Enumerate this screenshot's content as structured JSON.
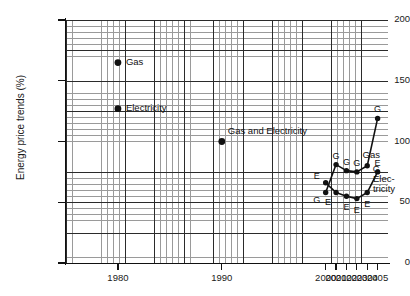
{
  "chart_data": {
    "type": "line",
    "title": "",
    "xlabel": "",
    "ylabel": "Energy price trends (%)",
    "xlim": [
      1975,
      2006
    ],
    "ylim": [
      0,
      200
    ],
    "grid": true,
    "legend": "inline-annotations",
    "x_ticks": [
      "1980",
      "1990",
      "2000",
      "2001",
      "2002",
      "2003",
      "2004",
      "2005"
    ],
    "x_tick_values": [
      1980,
      1990,
      2000,
      2001,
      2002,
      2003,
      2004,
      2005
    ],
    "y_ticks": [
      "0",
      "50",
      "100",
      "150",
      "200"
    ],
    "y_tick_values": [
      0,
      50,
      100,
      150,
      200
    ],
    "series": [
      {
        "name": "Gas",
        "marker_letter": "G",
        "x": [
          1980,
          1990,
          2000,
          2001,
          2002,
          2003,
          2004,
          2005
        ],
        "values": [
          165,
          100,
          58,
          81,
          76,
          75,
          80,
          119
        ]
      },
      {
        "name": "Electricity",
        "marker_letter": "E",
        "x": [
          1980,
          1990,
          2000,
          2001,
          2002,
          2003,
          2004,
          2005
        ],
        "values": [
          127,
          100,
          66,
          58,
          55,
          53,
          58,
          75
        ]
      }
    ],
    "annotations": [
      {
        "text": "Gas",
        "x": 1980,
        "y": 165,
        "note": "label for 1980 isolated gas point"
      },
      {
        "text": "Electricity",
        "x": 1980,
        "y": 127,
        "note": "label for 1980 isolated electricity point"
      },
      {
        "text": "Gas and Electricity",
        "x": 1990,
        "y": 100,
        "note": "shared 1990 point label"
      },
      {
        "text": "Gas",
        "x": 2003.6,
        "y": 88,
        "note": "gas series label near right"
      },
      {
        "text": "Elec-",
        "x": 2004.5,
        "y": 68,
        "note": "electricity series label line 1"
      },
      {
        "text": "tricity",
        "x": 2004.5,
        "y": 60,
        "note": "electricity series label line 2"
      }
    ],
    "point_letters": {
      "gas": [
        "",
        "",
        "G",
        "G",
        "G",
        "G",
        "G",
        "G"
      ],
      "electricity": [
        "",
        "",
        "E",
        "E",
        "E",
        "E",
        "E",
        "E"
      ]
    }
  },
  "axis": {
    "y_title": "Energy price trends (%)"
  },
  "colors": {
    "series_line": "#111111",
    "marker": "#111111",
    "grid_minor": "#9a9a9a",
    "grid_major": "#2b2b2b",
    "background": "#ffffff",
    "text": "#1a1a1a"
  }
}
